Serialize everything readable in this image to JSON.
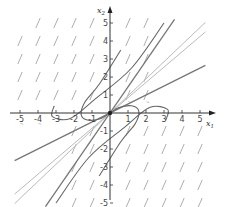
{
  "chart_data": {
    "type": "phase-portrait",
    "title": "",
    "xlabel": "x1",
    "ylabel": "x2",
    "xlim": [
      -5.5,
      5.5
    ],
    "ylim": [
      -5.5,
      5.8
    ],
    "x_ticks": [
      -5,
      -4,
      -3,
      -2,
      -1,
      1,
      2,
      3,
      4,
      5
    ],
    "y_ticks": [
      -5,
      -4,
      -3,
      -2,
      -1,
      1,
      2,
      3,
      4,
      5
    ],
    "x_tick_labels": [
      "-5",
      "-4",
      "-3",
      "-2",
      "-1",
      "1",
      "2",
      "3",
      "4",
      "5"
    ],
    "y_tick_labels": [
      "-5",
      "-4",
      "-3",
      "-2",
      "-1",
      "1",
      "2",
      "3",
      "4",
      "5"
    ],
    "grid": false,
    "equilibrium": {
      "x": 0,
      "y": 0,
      "label": "origin (node)"
    },
    "straight_line_solutions": [
      {
        "name": "steep-eigenline",
        "slope": 1.45,
        "color": "#777777"
      },
      {
        "name": "shallow-eigenline",
        "slope": 0.5,
        "color": "#777777"
      },
      {
        "name": "middle-line-1",
        "slope": 0.95,
        "color": "#bbbbbb"
      },
      {
        "name": "middle-line-2",
        "slope": 0.85,
        "color": "#bbbbbb"
      }
    ],
    "trajectories": [
      {
        "name": "upper-left-outer",
        "points": [
          [
            3.0,
            5.0
          ],
          [
            1.2,
            2.5
          ],
          [
            -0.8,
            0.8
          ],
          [
            -2.2,
            -0.3
          ],
          [
            -3.2,
            -0.2
          ],
          [
            -3.1,
            0.4
          ]
        ]
      },
      {
        "name": "upper-left-inner",
        "points": [
          [
            0.6,
            3.5
          ],
          [
            -0.6,
            1.6
          ],
          [
            -1.4,
            0.6
          ],
          [
            -1.6,
            -0.1
          ],
          [
            -1.2,
            -0.4
          ],
          [
            -0.5,
            -0.3
          ],
          [
            0,
            0
          ]
        ]
      },
      {
        "name": "lower-right-inner",
        "points": [
          [
            -0.6,
            -3.5
          ],
          [
            0.6,
            -1.6
          ],
          [
            1.4,
            -0.6
          ],
          [
            1.6,
            0.1
          ],
          [
            1.2,
            0.4
          ],
          [
            0.5,
            0.3
          ],
          [
            0,
            0
          ]
        ]
      },
      {
        "name": "lower-right-outer",
        "points": [
          [
            -3.0,
            -5.0
          ],
          [
            -1.2,
            -2.5
          ],
          [
            0.8,
            -0.8
          ],
          [
            2.2,
            0.3
          ],
          [
            3.2,
            0.2
          ],
          [
            3.1,
            -0.4
          ]
        ]
      }
    ],
    "direction_field": {
      "slope_visual": "approx 2 (steep, positive)",
      "spacing": 1
    }
  },
  "axes": {
    "x_label_main": "x",
    "x_label_sub": "1",
    "y_label_main": "x",
    "y_label_sub": "2"
  }
}
